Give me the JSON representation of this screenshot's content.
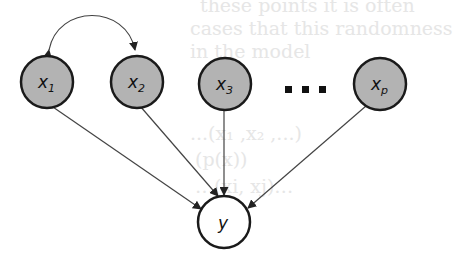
{
  "ghost_text": [
    {
      "text": "these points it is often",
      "x": 200,
      "y": -6
    },
    {
      "text": "cases that this randomness",
      "x": 190,
      "y": 17
    },
    {
      "text": "in the model",
      "x": 190,
      "y": 40
    },
    {
      "text": "...(x₁ ,x₂ ,...)",
      "x": 190,
      "y": 122
    },
    {
      "text": "(p(x))",
      "x": 195,
      "y": 148
    },
    {
      "text": "…(xi, xj)…",
      "x": 195,
      "y": 175
    }
  ],
  "diagram": {
    "title": "",
    "colors": {
      "node_fill": "#b3b3b3",
      "node_stroke": "#1a1a1a",
      "outcome_fill": "#ffffff",
      "edge": "#444444"
    },
    "nodes": [
      {
        "id": "x1",
        "label": "x",
        "sub": "1",
        "cx": 47,
        "cy": 82,
        "r": 26,
        "shaded": true
      },
      {
        "id": "x2",
        "label": "x",
        "sub": "2",
        "cx": 137,
        "cy": 82,
        "r": 26,
        "shaded": true
      },
      {
        "id": "x3",
        "label": "x",
        "sub": "3",
        "cx": 225,
        "cy": 84,
        "r": 26,
        "shaded": true
      },
      {
        "id": "xp",
        "label": "x",
        "sub": "p",
        "cx": 380,
        "cy": 84,
        "r": 26,
        "shaded": true
      },
      {
        "id": "y",
        "label": "y",
        "sub": "",
        "cx": 224,
        "cy": 222,
        "r": 26,
        "shaded": false
      }
    ],
    "ellipsis": "...",
    "edges": [
      {
        "from": "x1",
        "to": "y",
        "type": "directed"
      },
      {
        "from": "x2",
        "to": "y",
        "type": "directed"
      },
      {
        "from": "x3",
        "to": "y",
        "type": "directed"
      },
      {
        "from": "xp",
        "to": "y",
        "type": "directed"
      },
      {
        "from": "x1",
        "to": "x2",
        "type": "bidirected-curved"
      }
    ]
  }
}
